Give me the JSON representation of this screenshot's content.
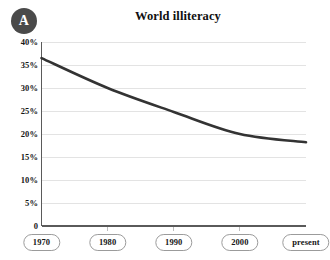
{
  "panel": {
    "badge_label": "A"
  },
  "chart_data": {
    "type": "line",
    "title": "World illiteracy",
    "xlabel": "",
    "ylabel": "",
    "categories": [
      "1970",
      "1980",
      "1990",
      "2000",
      "present"
    ],
    "x": [
      1970,
      1980,
      1990,
      2000,
      2010
    ],
    "values": [
      36.5,
      30.0,
      24.8,
      20.0,
      18.2
    ],
    "series": [
      {
        "name": "World illiteracy",
        "values": [
          36.5,
          30.0,
          24.8,
          20.0,
          18.2
        ],
        "color": "#333333"
      }
    ],
    "ylim": [
      0,
      40
    ],
    "xlim": [
      1970,
      2010
    ],
    "ytick_values": [
      40,
      35,
      30,
      25,
      20,
      15,
      10,
      5,
      0
    ],
    "ytick_labels": [
      "40%",
      "35%",
      "30%",
      "25%",
      "20%",
      "15%",
      "10%",
      "5%",
      "0"
    ],
    "xtick_labels": [
      "1970",
      "1980",
      "1990",
      "2000",
      "present"
    ],
    "grid": "horizontal",
    "legend": "none",
    "line_color": "#333333",
    "grid_color": "#e3e3e3",
    "axis_color": "#5a5a5a"
  }
}
